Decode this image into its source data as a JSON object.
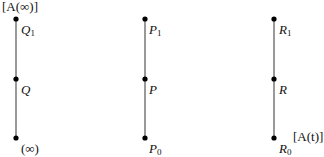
{
  "diagram": {
    "chains": [
      {
        "id": "left",
        "top_annotation": "[A(∞)]",
        "nodes": [
          {
            "label": "Q",
            "sub": "1"
          },
          {
            "label": "Q",
            "sub": ""
          },
          {
            "label": "(∞)",
            "sub": ""
          }
        ]
      },
      {
        "id": "middle",
        "nodes": [
          {
            "label": "P",
            "sub": "1"
          },
          {
            "label": "P",
            "sub": ""
          },
          {
            "label": "P",
            "sub": "0"
          }
        ]
      },
      {
        "id": "right",
        "bottom_annotation": "[A(t)]",
        "nodes": [
          {
            "label": "R",
            "sub": "1"
          },
          {
            "label": "R",
            "sub": ""
          },
          {
            "label": "R",
            "sub": "0"
          }
        ]
      }
    ],
    "colors": {
      "line": "#555555",
      "node": "#000000"
    }
  }
}
